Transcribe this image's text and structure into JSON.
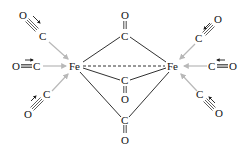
{
  "diagram": {
    "title": "",
    "molecule": "Fe2(CO)9",
    "colors": {
      "bond": "#1a1a1a",
      "donor_arrow": "#b8b8b8",
      "text": "#111111",
      "background": "#ffffff"
    },
    "metals": [
      {
        "id": "fe_left",
        "label": "Fe",
        "x": 75,
        "y": 69
      },
      {
        "id": "fe_right",
        "label": "Fe",
        "x": 173,
        "y": 69
      }
    ],
    "bridging_carbonyls": [
      {
        "id": "bridge_top",
        "c": {
          "label": "C",
          "x": 125,
          "y": 39
        },
        "o": {
          "label": "O",
          "x": 125,
          "y": 18
        }
      },
      {
        "id": "bridge_middle",
        "c": {
          "label": "C",
          "x": 125,
          "y": 84
        },
        "o": {
          "label": "O",
          "x": 125,
          "y": 102
        }
      },
      {
        "id": "bridge_bottom",
        "c": {
          "label": "C",
          "x": 125,
          "y": 123
        },
        "o": {
          "label": "O",
          "x": 125,
          "y": 143
        }
      }
    ],
    "terminal_carbonyls": [
      {
        "id": "tl_upper",
        "c": {
          "label": "C",
          "x": 43,
          "y": 39
        },
        "o": {
          "label": "O",
          "x": 23,
          "y": 18
        }
      },
      {
        "id": "tl_middle",
        "c": {
          "label": "C",
          "x": 37,
          "y": 69
        },
        "o": {
          "label": "O",
          "x": 16,
          "y": 69
        }
      },
      {
        "id": "tl_lower",
        "c": {
          "label": "C",
          "x": 47,
          "y": 97
        },
        "o": {
          "label": "O",
          "x": 28,
          "y": 117
        }
      },
      {
        "id": "tr_upper",
        "c": {
          "label": "C",
          "x": 199,
          "y": 41
        },
        "o": {
          "label": "O",
          "x": 218,
          "y": 22
        }
      },
      {
        "id": "tr_middle",
        "c": {
          "label": "C",
          "x": 212,
          "y": 69
        },
        "o": {
          "label": "O",
          "x": 232,
          "y": 69
        }
      },
      {
        "id": "tr_lower",
        "c": {
          "label": "C",
          "x": 200,
          "y": 97
        },
        "o": {
          "label": "O",
          "x": 219,
          "y": 116
        }
      }
    ],
    "metal_metal_bond": "dashed"
  }
}
